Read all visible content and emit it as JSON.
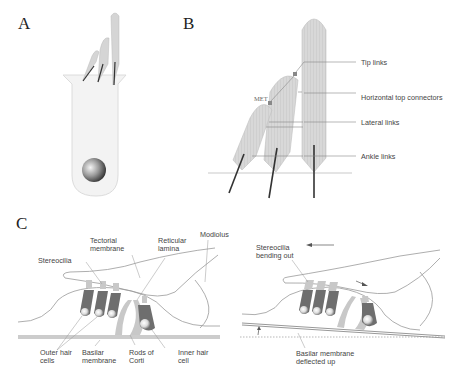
{
  "panels": {
    "a": {
      "label": "A"
    },
    "b": {
      "label": "B",
      "met_label": "MET",
      "callouts": [
        "Tip links",
        "Horizontal top connectors",
        "Lateral links",
        "Ankle links"
      ]
    },
    "c": {
      "label": "C",
      "left": {
        "tectorial": [
          "Tectorial",
          "membrane"
        ],
        "reticular": [
          "Reticular",
          "lamina"
        ],
        "modiolus": "Modiolus",
        "stereocilia": "Stereocilia",
        "outer_hair": [
          "Outer hair",
          "cells"
        ],
        "basilar": [
          "Basilar",
          "membrane"
        ],
        "rods": [
          "Rods of",
          "Corti"
        ],
        "inner_hair": [
          "Inner hair",
          "cell"
        ]
      },
      "right": {
        "stereocilia_bending": [
          "Stereocilia",
          "bending out"
        ],
        "basilar_deflected": [
          "Basilar membrane",
          "deflected up"
        ]
      }
    }
  },
  "colors": {
    "stereocilia_fill": "#d9d9d9",
    "hair_cell_fill": "#6e6e6e",
    "line": "#8a8a8a",
    "text": "#444444"
  }
}
